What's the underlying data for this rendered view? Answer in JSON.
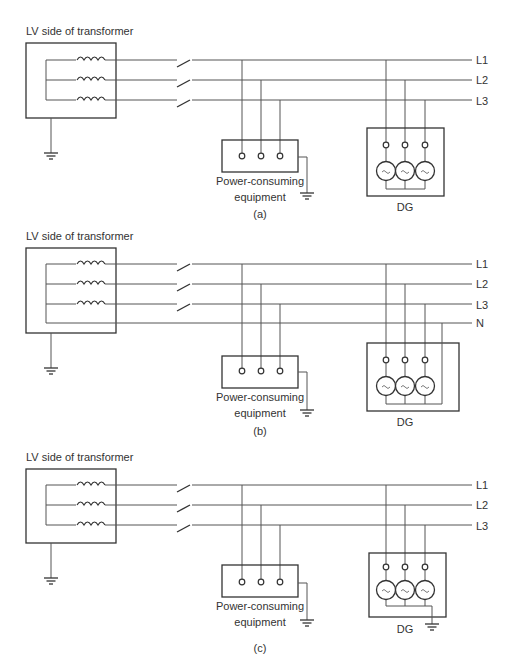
{
  "diagram": {
    "panels": [
      {
        "id": "a",
        "caption": "(a)",
        "transformer_label": "LV side of transformer",
        "line_labels": [
          "L1",
          "L2",
          "L3"
        ],
        "load_label_line1": "Power-consuming",
        "load_label_line2": "equipment",
        "generator_label": "DG",
        "has_neutral": false,
        "dg_grounded": false
      },
      {
        "id": "b",
        "caption": "(b)",
        "transformer_label": "LV side of transformer",
        "line_labels": [
          "L1",
          "L2",
          "L3",
          "N"
        ],
        "load_label_line1": "Power-consuming",
        "load_label_line2": "equipment",
        "generator_label": "DG",
        "has_neutral": true,
        "dg_grounded": false
      },
      {
        "id": "c",
        "caption": "(c)",
        "transformer_label": "LV side of transformer",
        "line_labels": [
          "L1",
          "L2",
          "L3"
        ],
        "load_label_line1": "Power-consuming",
        "load_label_line2": "equipment",
        "generator_label": "DG",
        "has_neutral": false,
        "dg_grounded": true
      }
    ],
    "icons": {
      "ground": "ground-icon",
      "switch": "switch-icon",
      "coil": "transformer-winding-icon",
      "generator": "ac-generator-icon",
      "terminal": "terminal-icon"
    },
    "generator_symbol": "~",
    "colors": {
      "line": "#555555",
      "outline": "#333333",
      "background": "#ffffff"
    }
  }
}
